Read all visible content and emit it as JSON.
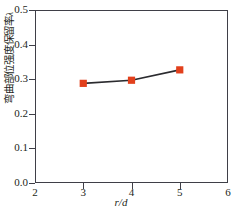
{
  "chart_data": {
    "type": "line",
    "title": "",
    "xlabel": "r/d",
    "ylabel": "弯曲部位强度保留率",
    "ylabel_symbol": "λ",
    "x": [
      3,
      4,
      5
    ],
    "values": [
      0.288,
      0.297,
      0.327
    ],
    "series": [
      {
        "name": "弯曲部位强度保留率",
        "x": [
          3,
          4,
          5
        ],
        "values": [
          0.288,
          0.297,
          0.327
        ]
      }
    ],
    "xlim": [
      2,
      6
    ],
    "ylim": [
      0.0,
      0.5
    ],
    "xticks": [
      "2",
      "3",
      "4",
      "5",
      "6"
    ],
    "xtick_values": [
      2,
      3,
      4,
      5,
      6
    ],
    "yticks": [
      "0.0",
      "0.1",
      "0.2",
      "0.3",
      "0.4",
      "0.5"
    ],
    "ytick_values": [
      0.0,
      0.1,
      0.2,
      0.3,
      0.4,
      0.5
    ],
    "grid": false,
    "legend": "none",
    "marker": "square",
    "marker_color": "#e2401c",
    "line_color": "#2b2b2f",
    "axis_color": "#3f3f47",
    "background": "#ffffff"
  }
}
